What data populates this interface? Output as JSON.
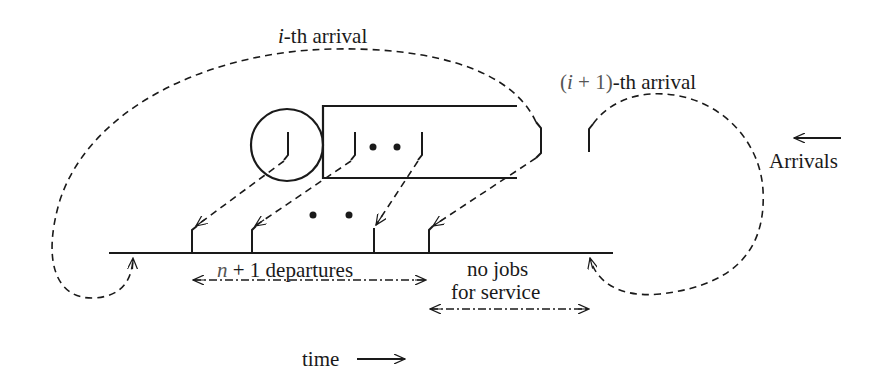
{
  "diagram": {
    "type": "queue-timeline",
    "labels": {
      "i_arrival_var": "i",
      "i_arrival_rest": "-th arrival",
      "next_arrival_open": "(",
      "next_arrival_var": "i",
      "next_arrival_plus": " + 1)",
      "next_arrival_rest": "-th arrival",
      "arrivals": "Arrivals",
      "departures_var": "n",
      "departures_rest": " + 1 departures",
      "no_jobs_line1": "no jobs",
      "no_jobs_line2": "for service",
      "time": "time"
    },
    "queue": {
      "server": "circle",
      "buffer_jobs_visible": 2,
      "ellipsis": "• •"
    },
    "timeline": {
      "departure_ticks": 4,
      "ellipsis": "• •",
      "arrival_markers": 2
    },
    "colors": {
      "stroke": "#1a1a1a",
      "background": "#ffffff"
    }
  }
}
